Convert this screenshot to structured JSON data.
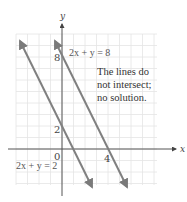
{
  "chart_data": {
    "type": "line",
    "title": "",
    "xlabel": "x",
    "ylabel": "y",
    "xlim": [
      -4,
      8
    ],
    "ylim": [
      -3.5,
      10
    ],
    "grid": true,
    "tick_labels": {
      "x": [
        "0",
        "4"
      ],
      "y": [
        "2",
        "8"
      ]
    },
    "series": [
      {
        "name": "2x + y = 2",
        "equation": "y = 2 - 2x",
        "points": [
          [
            -3.7,
            9.4
          ],
          [
            2.6,
            -3.2
          ]
        ]
      },
      {
        "name": "2x + y = 8",
        "equation": "y = 8 - 2x",
        "points": [
          [
            -0.7,
            9.4
          ],
          [
            5.6,
            -3.2
          ]
        ]
      }
    ],
    "annotations": [
      {
        "text": "2x + y = 8",
        "near": "top of right line"
      },
      {
        "text": "2x + y = 2",
        "near": "below origin, left"
      },
      {
        "text": "The lines do not intersect; no solution."
      }
    ]
  },
  "labels": {
    "x_axis": "x",
    "y_axis": "y",
    "origin": "0",
    "tick_x4": "4",
    "tick_y2": "2",
    "tick_y8": "8",
    "eq_top": "2x + y = 8",
    "eq_bottom": "2x + y = 2",
    "note_line1": "The lines do",
    "note_line2": "not intersect;",
    "note_line3": "no solution."
  },
  "colors": {
    "line": "#808080",
    "axis": "#555555",
    "grid": "#e2e2e2"
  }
}
